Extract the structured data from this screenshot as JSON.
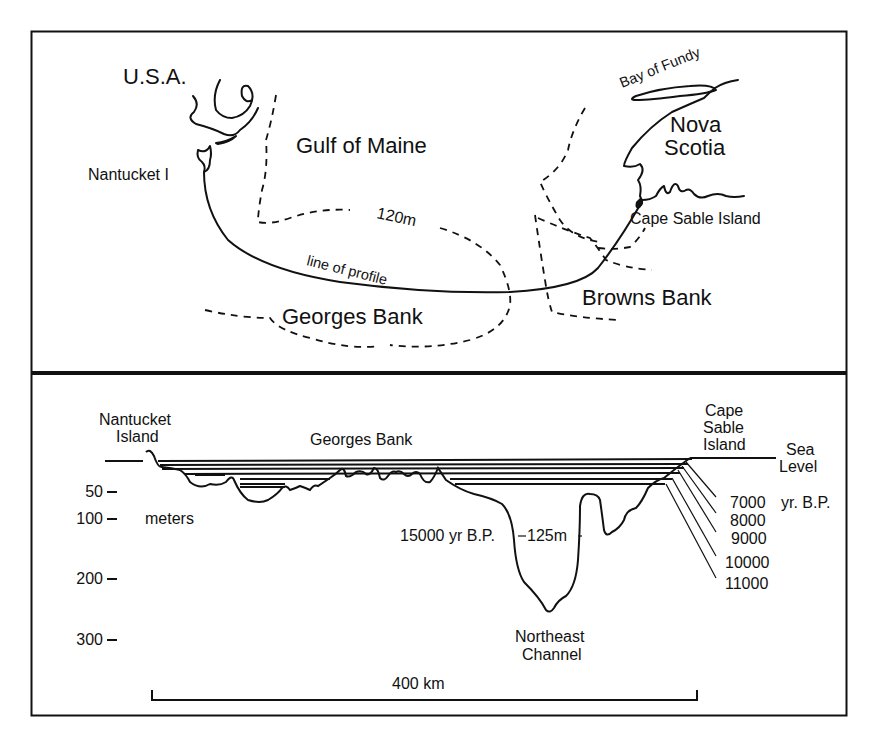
{
  "figure": {
    "map_panel": {
      "labels": {
        "usa": "U.S.A.",
        "nantucket": "Nantucket I",
        "gulf_of_maine": "Gulf of Maine",
        "bay_of_fundy": "Bay of Fundy",
        "nova": "Nova",
        "scotia": "Scotia",
        "cape_sable": "Cape Sable Island",
        "contour_120m": "120m",
        "line_of_profile": "line of profile",
        "georges_bank": "Georges Bank",
        "browns_bank": "Browns Bank"
      }
    },
    "profile_panel": {
      "labels": {
        "nantucket_line1": "Nantucket",
        "nantucket_line2": "Island",
        "georges_bank": "Georges Bank",
        "cape_line1": "Cape",
        "cape_line2": "Sable",
        "cape_line3": "Island",
        "sea_line1": "Sea",
        "sea_line2": "Level",
        "yr_bp": "yr. B.P.",
        "bp_15000": "15000 yr B.P.",
        "depth_125": "125m",
        "northeast_line1": "Northeast",
        "northeast_line2": "Channel",
        "scale_bar": "400 km",
        "meters": "meters"
      },
      "depth_axis": [
        {
          "value": "50",
          "y": 491
        },
        {
          "value": "100",
          "y": 518
        },
        {
          "value": "200",
          "y": 578
        },
        {
          "value": "300",
          "y": 639
        }
      ],
      "shoreline_ages": [
        "7000",
        "8000",
        "9000",
        "10000",
        "11000"
      ]
    }
  }
}
